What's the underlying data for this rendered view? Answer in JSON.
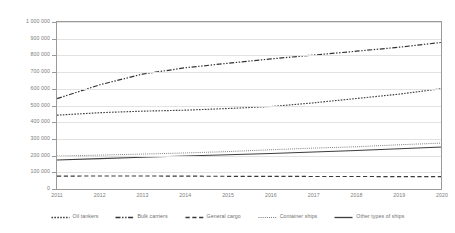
{
  "chart_data": {
    "type": "line",
    "title": "",
    "xlabel": "",
    "ylabel": "",
    "x": [
      2011,
      2012,
      2013,
      2014,
      2015,
      2016,
      2017,
      2018,
      2019,
      2020
    ],
    "categories": [
      "2011",
      "2012",
      "2013",
      "2014",
      "2015",
      "2016",
      "2017",
      "2018",
      "2019",
      "2020"
    ],
    "ylim": [
      0,
      1000000
    ],
    "y_ticks": [
      0,
      100000,
      200000,
      300000,
      400000,
      500000,
      600000,
      700000,
      800000,
      900000,
      1000000
    ],
    "y_tick_labels": [
      "0",
      "100 000",
      "200 000",
      "300 000",
      "400 000",
      "500 000",
      "600 000",
      "700 000",
      "800 000",
      "900 000",
      "1 000 000"
    ],
    "grid": true,
    "legend_position": "bottom",
    "series": [
      {
        "name": "Oil tankers",
        "dash": "dotted",
        "color": "#404040",
        "values": [
          442000,
          457000,
          466000,
          472000,
          482000,
          494000,
          516000,
          542000,
          568000,
          601000
        ]
      },
      {
        "name": "Bulk carriers",
        "dash": "dash-dot-dot",
        "color": "#333333",
        "values": [
          541000,
          624000,
          688000,
          726000,
          753000,
          779000,
          802000,
          825000,
          849000,
          878000
        ]
      },
      {
        "name": "General cargo",
        "dash": "long-dash",
        "color": "#3a3a3a",
        "values": [
          77000,
          78000,
          78000,
          77000,
          76000,
          76000,
          75000,
          75000,
          74000,
          74000
        ]
      },
      {
        "name": "Container ships",
        "dash": "fine-dotted",
        "color": "#6a6a6a",
        "values": [
          197000,
          203000,
          209000,
          216000,
          224000,
          235000,
          245000,
          253000,
          265000,
          275000
        ]
      },
      {
        "name": "Other types of ships",
        "dash": "solid",
        "color": "#3d3d3d",
        "values": [
          174000,
          182000,
          190000,
          198000,
          205000,
          213000,
          222000,
          231000,
          241000,
          252000
        ]
      }
    ]
  }
}
